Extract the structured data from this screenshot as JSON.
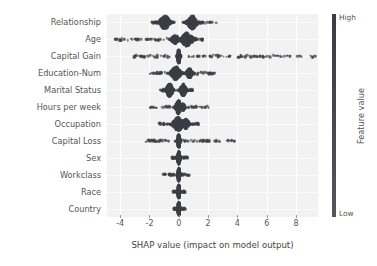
{
  "chart_data": {
    "type": "scatter",
    "plot_kind": "shap-beeswarm-summary",
    "title": "",
    "xlabel": "SHAP value (impact on model output)",
    "ylabel": "",
    "xlim": [
      -4.9,
      9.5
    ],
    "xticks": [
      -4,
      -2,
      0,
      2,
      4,
      6,
      8
    ],
    "xticklabels": [
      "-4",
      "-2",
      "0",
      "2",
      "4",
      "6",
      "8"
    ],
    "grid": true,
    "grid_color": "#ffffff",
    "axes_facecolor": "#f2f2f2",
    "categories": [
      "Relationship",
      "Age",
      "Capital Gain",
      "Education-Num",
      "Marital Status",
      "Hours per week",
      "Occupation",
      "Capital Loss",
      "Sex",
      "Workclass",
      "Race",
      "Country"
    ],
    "colorbar": {
      "label": "Feature value",
      "high_label": "High",
      "low_label": "Low",
      "position": "right",
      "high_color": "#3c3c42",
      "low_color": "#55555c"
    },
    "point_color": "#3d3d45",
    "series": [
      {
        "name": "Relationship",
        "min": -1.85,
        "max": 2.55,
        "clusters": [
          {
            "center": -0.95,
            "width": 0.42,
            "density": 1.0
          },
          {
            "center": 0.92,
            "width": 0.4,
            "density": 0.95
          }
        ],
        "tails": [
          {
            "from": -1.85,
            "to": -1.35,
            "density": 0.22
          },
          {
            "from": 1.35,
            "to": 2.55,
            "density": 0.2
          }
        ]
      },
      {
        "name": "Age",
        "min": -4.35,
        "max": 1.62,
        "clusters": [
          {
            "center": 0.55,
            "width": 0.48,
            "density": 1.0
          },
          {
            "center": -0.25,
            "width": 0.3,
            "density": 0.45
          }
        ],
        "tails": [
          {
            "from": -4.35,
            "to": -2.95,
            "density": 0.1
          },
          {
            "from": -2.95,
            "to": -0.75,
            "density": 0.32
          },
          {
            "from": 1.0,
            "to": 1.62,
            "density": 0.22
          }
        ]
      },
      {
        "name": "Capital Gain",
        "min": -3.05,
        "max": 9.35,
        "clusters": [
          {
            "center": 0.0,
            "width": 0.1,
            "density": 1.0
          }
        ],
        "tails": [
          {
            "from": -3.05,
            "to": -0.55,
            "density": 0.3
          },
          {
            "from": 0.55,
            "to": 9.35,
            "density": 0.3
          }
        ]
      },
      {
        "name": "Education-Num",
        "min": -1.95,
        "max": 2.42,
        "clusters": [
          {
            "center": -0.2,
            "width": 0.38,
            "density": 1.0
          },
          {
            "center": 0.72,
            "width": 0.24,
            "density": 0.55
          }
        ],
        "tails": [
          {
            "from": -1.95,
            "to": -0.95,
            "density": 0.16
          },
          {
            "from": 1.05,
            "to": 2.42,
            "density": 0.22
          }
        ]
      },
      {
        "name": "Marital Status",
        "min": -1.25,
        "max": 0.95,
        "clusters": [
          {
            "center": -0.62,
            "width": 0.26,
            "density": 1.0
          },
          {
            "center": 0.3,
            "width": 0.22,
            "density": 0.85
          }
        ],
        "tails": [
          {
            "from": -1.25,
            "to": -0.9,
            "density": 0.16
          },
          {
            "from": 0.58,
            "to": 0.95,
            "density": 0.14
          }
        ]
      },
      {
        "name": "Hours per week",
        "min": -1.95,
        "max": 2.05,
        "clusters": [
          {
            "center": -0.02,
            "width": 0.2,
            "density": 1.0
          },
          {
            "center": 0.28,
            "width": 0.16,
            "density": 0.35
          }
        ],
        "tails": [
          {
            "from": -1.95,
            "to": -0.55,
            "density": 0.13
          },
          {
            "from": 0.55,
            "to": 2.05,
            "density": 0.18
          }
        ]
      },
      {
        "name": "Occupation",
        "min": -1.35,
        "max": 1.35,
        "clusters": [
          {
            "center": -0.05,
            "width": 0.46,
            "density": 1.0
          },
          {
            "center": 0.48,
            "width": 0.26,
            "density": 0.6
          }
        ],
        "tails": [
          {
            "from": -1.35,
            "to": -0.75,
            "density": 0.22
          },
          {
            "from": 0.85,
            "to": 1.35,
            "density": 0.18
          }
        ]
      },
      {
        "name": "Capital Loss",
        "min": -2.25,
        "max": 3.8,
        "clusters": [
          {
            "center": 0.0,
            "width": 0.09,
            "density": 1.0
          }
        ],
        "tails": [
          {
            "from": -2.25,
            "to": -0.25,
            "density": 0.26
          },
          {
            "from": 0.25,
            "to": 3.8,
            "density": 0.28
          }
        ]
      },
      {
        "name": "Sex",
        "min": -0.45,
        "max": 0.58,
        "clusters": [
          {
            "center": 0.0,
            "width": 0.1,
            "density": 1.0
          }
        ],
        "tails": [
          {
            "from": -0.45,
            "to": -0.12,
            "density": 0.3
          },
          {
            "from": 0.12,
            "to": 0.58,
            "density": 0.3
          }
        ]
      },
      {
        "name": "Workclass",
        "min": -1.05,
        "max": 0.72,
        "clusters": [
          {
            "center": 0.0,
            "width": 0.09,
            "density": 1.0
          }
        ],
        "tails": [
          {
            "from": -1.05,
            "to": -0.12,
            "density": 0.22
          },
          {
            "from": 0.12,
            "to": 0.72,
            "density": 0.24
          }
        ]
      },
      {
        "name": "Race",
        "min": -0.38,
        "max": 0.42,
        "clusters": [
          {
            "center": 0.0,
            "width": 0.08,
            "density": 1.0
          }
        ],
        "tails": [
          {
            "from": -0.38,
            "to": -0.1,
            "density": 0.26
          },
          {
            "from": 0.1,
            "to": 0.42,
            "density": 0.26
          }
        ]
      },
      {
        "name": "Country",
        "min": -0.32,
        "max": 0.45,
        "clusters": [
          {
            "center": 0.0,
            "width": 0.08,
            "density": 1.0
          }
        ],
        "tails": [
          {
            "from": -0.32,
            "to": -0.1,
            "density": 0.24
          },
          {
            "from": 0.1,
            "to": 0.45,
            "density": 0.26
          }
        ]
      }
    ]
  }
}
